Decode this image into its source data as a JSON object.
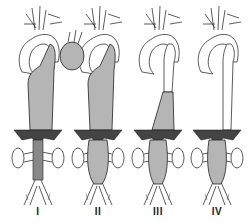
{
  "figure": {
    "panels": [
      {
        "id": "I",
        "label": "I",
        "cx": 38
      },
      {
        "id": "II",
        "label": "II",
        "cx": 98
      },
      {
        "id": "III",
        "label": "III",
        "cx": 158
      },
      {
        "id": "IV",
        "label": "IV",
        "cx": 217
      }
    ]
  }
}
